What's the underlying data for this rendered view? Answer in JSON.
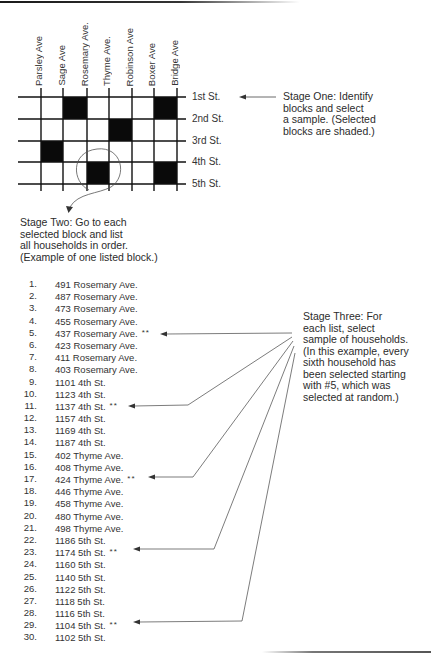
{
  "stage_one": {
    "avenues": [
      "Parsley Ave",
      "Sage Ave",
      "Rosemary Ave.",
      "Thyme Ave.",
      "Robinson Ave",
      "Boxer Ave",
      "Bridge Ave"
    ],
    "streets": [
      "1st St.",
      "2nd St.",
      "3rd St.",
      "4th St.",
      "5th St."
    ],
    "grid": {
      "block_rows": 4,
      "block_columns": 8,
      "shaded_blocks": [
        [
          0,
          2
        ],
        [
          0,
          6
        ],
        [
          1,
          4
        ],
        [
          2,
          1
        ],
        [
          3,
          3
        ],
        [
          3,
          6
        ]
      ],
      "circled_block": [
        3,
        3
      ]
    },
    "caption_lines": [
      "Stage One: Identify",
      "blocks and select",
      "a sample. (Selected",
      "blocks are shaded.)"
    ]
  },
  "stage_two": {
    "caption_lines": [
      "Stage Two: Go to each",
      "selected block and list",
      "all households in order.",
      "(Example of one listed block.)"
    ],
    "households": [
      {
        "num": "1.",
        "address": "491 Rosemary Ave.",
        "mark": ""
      },
      {
        "num": "2.",
        "address": "487 Rosemary Ave.",
        "mark": ""
      },
      {
        "num": "3.",
        "address": "473 Rosemary Ave.",
        "mark": ""
      },
      {
        "num": "4.",
        "address": "455 Rosemary Ave.",
        "mark": ""
      },
      {
        "num": "5.",
        "address": "437 Rosemary Ave.",
        "mark": "**"
      },
      {
        "num": "6.",
        "address": "423 Rosemary Ave.",
        "mark": ""
      },
      {
        "num": "7.",
        "address": "411 Rosemary Ave.",
        "mark": ""
      },
      {
        "num": "8.",
        "address": "403 Rosemary Ave.",
        "mark": ""
      },
      {
        "num": "9.",
        "address": "1101 4th St.",
        "mark": ""
      },
      {
        "num": "10.",
        "address": "1123 4th St.",
        "mark": ""
      },
      {
        "num": "11.",
        "address": "1137 4th St.",
        "mark": "**"
      },
      {
        "num": "12.",
        "address": "1157 4th St.",
        "mark": ""
      },
      {
        "num": "13.",
        "address": "1169 4th St.",
        "mark": ""
      },
      {
        "num": "14.",
        "address": "1187 4th St.",
        "mark": ""
      },
      {
        "num": "15.",
        "address": "402 Thyme Ave.",
        "mark": ""
      },
      {
        "num": "16.",
        "address": "408 Thyme Ave.",
        "mark": ""
      },
      {
        "num": "17.",
        "address": "424 Thyme Ave.",
        "mark": "**"
      },
      {
        "num": "18.",
        "address": "446 Thyme Ave.",
        "mark": ""
      },
      {
        "num": "19.",
        "address": "458 Thyme Ave.",
        "mark": ""
      },
      {
        "num": "20.",
        "address": "480 Thyme Ave.",
        "mark": ""
      },
      {
        "num": "21.",
        "address": "498 Thyme Ave.",
        "mark": ""
      },
      {
        "num": "22.",
        "address": "1186 5th St.",
        "mark": ""
      },
      {
        "num": "23.",
        "address": "1174 5th St.",
        "mark": "**"
      },
      {
        "num": "24.",
        "address": "1160 5th St.",
        "mark": ""
      },
      {
        "num": "25.",
        "address": "1140 5th St.",
        "mark": ""
      },
      {
        "num": "26.",
        "address": "1122 5th St.",
        "mark": ""
      },
      {
        "num": "27.",
        "address": "1118 5th St.",
        "mark": ""
      },
      {
        "num": "28.",
        "address": "1116 5th St.",
        "mark": ""
      },
      {
        "num": "29.",
        "address": "1104 5th St.",
        "mark": "**"
      },
      {
        "num": "30.",
        "address": "1102 5th St.",
        "mark": ""
      }
    ]
  },
  "stage_three": {
    "caption_lines": [
      "Stage Three: For",
      "each list, select",
      "sample of households.",
      "(In this example, every",
      "sixth household has",
      "been selected starting",
      "with #5, which was",
      "selected at random.)"
    ],
    "selected_households": [
      5,
      11,
      17,
      23,
      29
    ]
  },
  "colors": {
    "ink": "#2b2b2b",
    "grid_line": "#111111",
    "shaded_block": "#0a0a0a",
    "arrow": "#444444"
  }
}
